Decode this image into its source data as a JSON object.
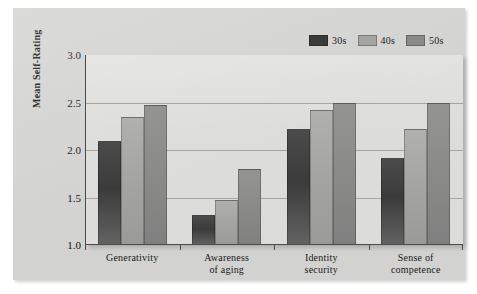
{
  "chart_data": {
    "type": "bar",
    "title": "",
    "subtitle": "",
    "xlabel": "",
    "ylabel": "Mean Self-Rating",
    "ylim": [
      1.0,
      3.0
    ],
    "yticks": [
      "1.0",
      "1.5",
      "2.0",
      "2.5",
      "3.0"
    ],
    "ytick_values": [
      1.0,
      1.5,
      2.0,
      2.5,
      3.0
    ],
    "gridlines": [
      1.5,
      2.0,
      2.5
    ],
    "grid": true,
    "legend_position": "top-right",
    "categories": [
      "Generativity",
      "Awareness of aging",
      "Identity security",
      "Sense of competence"
    ],
    "category_lines": [
      [
        "Generativity"
      ],
      [
        "Awareness",
        "of aging"
      ],
      [
        "Identity",
        "security"
      ],
      [
        "Sense of",
        "competence"
      ]
    ],
    "series": [
      {
        "name": "30s",
        "color": "#3b3b3b",
        "values": [
          2.1,
          1.32,
          2.22,
          1.92
        ]
      },
      {
        "name": "40s",
        "color": "#a4a4a2",
        "values": [
          2.35,
          1.47,
          2.42,
          2.22
        ]
      },
      {
        "name": "50s",
        "color": "#8a8a88",
        "values": [
          2.47,
          1.8,
          2.5,
          2.5
        ]
      }
    ]
  },
  "legend": {
    "entries": [
      {
        "label": "30s",
        "swatch": "#3b3b3b"
      },
      {
        "label": "40s",
        "swatch": "#a4a4a2"
      },
      {
        "label": "50s",
        "swatch": "#8a8a88"
      }
    ]
  },
  "axis": {
    "y_title": "Mean Self-Rating",
    "y_ticks": [
      "3.0",
      "2.5",
      "2.0",
      "1.5",
      "1.0"
    ]
  },
  "colors": {
    "page_background": "#ffffff",
    "panel_background": "#d2d2d0",
    "plot_background": "#dcdcda",
    "axis_line": "#4a4a4a",
    "gridline": "#787876",
    "text": "#111111"
  }
}
